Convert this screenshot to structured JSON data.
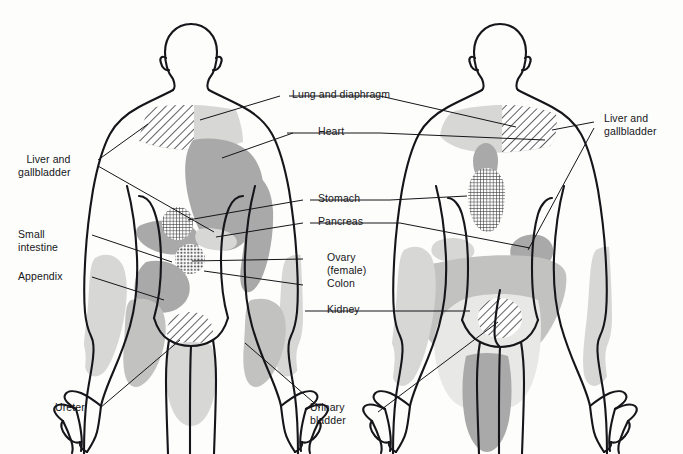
{
  "figure": {
    "title_visible": false,
    "view_left": "anterior",
    "view_right": "posterior",
    "bg_color": "#fdfdfb",
    "ink_color": "#15151a",
    "tone_light": "#d7d7d5",
    "tone_mid": "#a9a9a9",
    "tone_dark": "#9a9a9a"
  },
  "labels": {
    "lung_diaphragm": "Lung and diaphragm",
    "heart": "Heart",
    "stomach": "Stomach",
    "pancreas": "Pancreas",
    "ovary": "Ovary\n(female)",
    "colon": "Colon",
    "kidney": "Kidney",
    "liver_gallbladder_left": "Liver and\ngallbladder",
    "liver_gallbladder_right": "Liver and\ngallbladder",
    "small_intestine": "Small\nintestine",
    "appendix": "Appendix",
    "ureter": "Ureter",
    "urinary_bladder": "Urinary\nbladder"
  },
  "regions": [
    {
      "name": "lung-and-diaphragm",
      "figure": "anterior",
      "pattern": "solid-light",
      "area": "neck-and-supraclavicular"
    },
    {
      "name": "liver-and-gallbladder",
      "figure": "anterior",
      "pattern": "diagonal-hatch",
      "area": "right-shoulder"
    },
    {
      "name": "heart",
      "figure": "anterior",
      "pattern": "solid-mid",
      "area": "left-chest-and-arm"
    },
    {
      "name": "stomach",
      "figure": "anterior",
      "pattern": "cross-hatch",
      "area": "epigastrium"
    },
    {
      "name": "liver-and-gallbladder-abdominal",
      "figure": "anterior",
      "pattern": "solid-mid",
      "area": "right-upper-quadrant"
    },
    {
      "name": "pancreas",
      "figure": "anterior",
      "pattern": "solid-light",
      "area": "left-upper-quadrant"
    },
    {
      "name": "ovary-female",
      "figure": "anterior",
      "pattern": "dotted",
      "area": "left-lower-quadrant"
    },
    {
      "name": "small-intestine",
      "figure": "anterior",
      "pattern": "solid-mid",
      "area": "periumbilical"
    },
    {
      "name": "appendix",
      "figure": "anterior",
      "pattern": "solid-mid",
      "area": "right-lower-quadrant"
    },
    {
      "name": "urinary-bladder",
      "figure": "anterior",
      "pattern": "diagonal-hatch",
      "area": "suprapubic"
    },
    {
      "name": "kidney-ureter",
      "figure": "anterior",
      "pattern": "solid-light",
      "area": "flank-and-groin"
    },
    {
      "name": "lung-and-diaphragm",
      "figure": "posterior",
      "pattern": "solid-light",
      "area": "upper-back-and-shoulders"
    },
    {
      "name": "liver-and-gallbladder",
      "figure": "posterior",
      "pattern": "diagonal-hatch",
      "area": "right-scapula"
    },
    {
      "name": "heart",
      "figure": "posterior",
      "pattern": "solid-mid",
      "area": "interscapular"
    },
    {
      "name": "stomach",
      "figure": "posterior",
      "pattern": "cross-hatch",
      "area": "mid-back"
    },
    {
      "name": "pancreas",
      "figure": "posterior",
      "pattern": "solid-light",
      "area": "lower-back-left"
    },
    {
      "name": "liver-and-gallbladder-flank",
      "figure": "posterior",
      "pattern": "solid-mid",
      "area": "lower-back-right"
    },
    {
      "name": "kidney",
      "figure": "posterior",
      "pattern": "solid-light",
      "area": "buttocks-and-thighs"
    },
    {
      "name": "urinary-bladder",
      "figure": "posterior",
      "pattern": "diagonal-hatch",
      "area": "sacrum"
    }
  ]
}
